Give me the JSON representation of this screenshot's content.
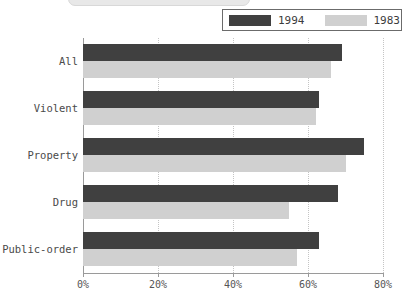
{
  "chart_data": {
    "type": "bar",
    "orientation": "horizontal",
    "title": "",
    "xlabel": "",
    "ylabel": "",
    "categories": [
      "All",
      "Violent",
      "Property",
      "Drug",
      "Public-order"
    ],
    "series": [
      {
        "name": "1994",
        "color": "#404040",
        "values": [
          69,
          63,
          75,
          68,
          63
        ]
      },
      {
        "name": "1983",
        "color": "#d0d0d0",
        "values": [
          66,
          62,
          70,
          55,
          57
        ]
      }
    ],
    "xlim": [
      0,
      80
    ],
    "xticks": [
      0,
      20,
      40,
      60,
      80
    ],
    "xtick_labels": [
      "0%",
      "20%",
      "40%",
      "60%",
      "80%"
    ],
    "grid": true,
    "grid_style": "dotted",
    "legend_position": "top-right"
  },
  "legend": {
    "entries": [
      {
        "label": "1994",
        "color": "#404040"
      },
      {
        "label": "1983",
        "color": "#d0d0d0"
      }
    ]
  },
  "colors": {
    "series_1994": "#404040",
    "series_1983": "#d0d0d0",
    "axis": "#9a9a9a",
    "grid": "#c4c4c4",
    "text": "#4a4a4a",
    "background": "#ffffff"
  }
}
